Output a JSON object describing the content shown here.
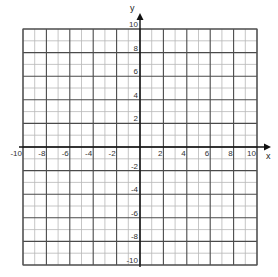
{
  "chart_data": {
    "type": "scatter",
    "title": "",
    "xlabel": "x",
    "ylabel": "y",
    "xlim": [
      -10,
      10
    ],
    "ylim": [
      -10,
      10
    ],
    "grid": true,
    "grid_minor_step": 1,
    "grid_major_step": 2,
    "x_ticks": [
      -10,
      -8,
      -6,
      -4,
      -2,
      2,
      4,
      6,
      8,
      10
    ],
    "x_tick_labels": [
      "-10",
      "-8",
      "-6",
      "-4",
      "-2",
      "2",
      "4",
      "6",
      "8",
      "10"
    ],
    "y_ticks": [
      10,
      8,
      6,
      4,
      2,
      -2,
      -4,
      -6,
      -8,
      -10
    ],
    "y_tick_labels": [
      "10",
      "8",
      "6",
      "4",
      "2",
      "-2",
      "-4",
      "-6",
      "-8",
      "-10"
    ],
    "series": [],
    "colors": {
      "minor_grid": "#b8b8b8",
      "major_grid": "#4a4a4a",
      "axis": "#111111",
      "text": "#333333"
    }
  }
}
